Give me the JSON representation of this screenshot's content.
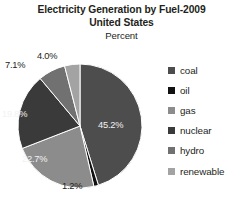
{
  "chart_data": {
    "type": "pie",
    "title": "Electricity Generation by Fuel-2009",
    "subtitle": "United States",
    "units_label": "Percent",
    "xlabel": "",
    "ylabel": "",
    "legend_position": "right",
    "grid": false,
    "start_angle_deg": 0,
    "direction": "clockwise",
    "categories": [
      "coal",
      "oil",
      "gas",
      "nuclear",
      "hydro",
      "renewable"
    ],
    "values": [
      45.2,
      1.2,
      22.7,
      19.8,
      7.1,
      4.0
    ],
    "labels": [
      "45.2%",
      "1.2%",
      "22.7%",
      "19.8%",
      "7.1%",
      "4.0%"
    ],
    "colors": [
      "#4d4d4d",
      "#111111",
      "#8c8c8c",
      "#3a3a3a",
      "#717171",
      "#a3a3a3"
    ],
    "label_placement": [
      "inside",
      "outside",
      "inside",
      "inside",
      "outside",
      "outside"
    ],
    "slices": [
      {
        "name": "coal",
        "value": 45.2,
        "label": "45.2%",
        "color": "#4d4d4d"
      },
      {
        "name": "oil",
        "value": 1.2,
        "label": "1.2%",
        "color": "#111111"
      },
      {
        "name": "gas",
        "value": 22.7,
        "label": "22.7%",
        "color": "#8c8c8c"
      },
      {
        "name": "nuclear",
        "value": 19.8,
        "label": "19.8%",
        "color": "#3a3a3a"
      },
      {
        "name": "hydro",
        "value": 7.1,
        "label": "7.1%",
        "color": "#717171"
      },
      {
        "name": "renewable",
        "value": 4.0,
        "label": "4.0%",
        "color": "#a3a3a3"
      }
    ]
  },
  "legend": {
    "items": [
      {
        "label": "coal",
        "color": "#4d4d4d"
      },
      {
        "label": "oil",
        "color": "#111111"
      },
      {
        "label": "gas",
        "color": "#8c8c8c"
      },
      {
        "label": "nuclear",
        "color": "#3a3a3a"
      },
      {
        "label": "hydro",
        "color": "#717171"
      },
      {
        "label": "renewable",
        "color": "#a3a3a3"
      }
    ]
  }
}
